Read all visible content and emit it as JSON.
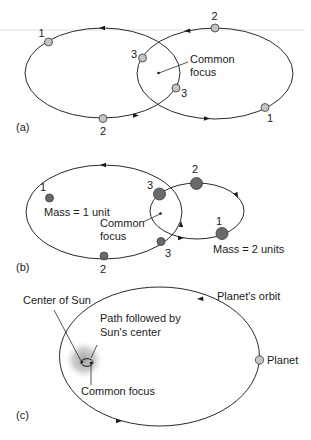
{
  "figure": {
    "colors": {
      "orbit_line": "#2a2a2a",
      "ball_light": "#c4c4c4",
      "ball_dark": "#6a6a6a",
      "ball_outline": "#3a3a3a",
      "sun_glow": "#9a9a9a",
      "background": "#ffffff"
    },
    "panel_a": {
      "label": "(a)",
      "common_focus_label_line1": "Common",
      "common_focus_label_line2": "focus",
      "left_orbit_positions": [
        "1",
        "2",
        "3"
      ],
      "right_orbit_positions": [
        "1",
        "2",
        "3"
      ]
    },
    "panel_b": {
      "label": "(b)",
      "common_focus_label_line1": "Common",
      "common_focus_label_line2": "focus",
      "small_mass_label": "Mass = 1 unit",
      "large_mass_label": "Mass = 2 units",
      "left_orbit_positions": [
        "1",
        "2",
        "3"
      ],
      "right_orbit_positions": [
        "1",
        "2",
        "3"
      ]
    },
    "panel_c": {
      "label": "(c)",
      "center_of_sun_label": "Center of Sun",
      "path_label_line1": "Path followed by",
      "path_label_line2": "Sun's center",
      "common_focus_label": "Common focus",
      "planet_orbit_label": "Planet's orbit",
      "planet_label": "Planet"
    }
  }
}
